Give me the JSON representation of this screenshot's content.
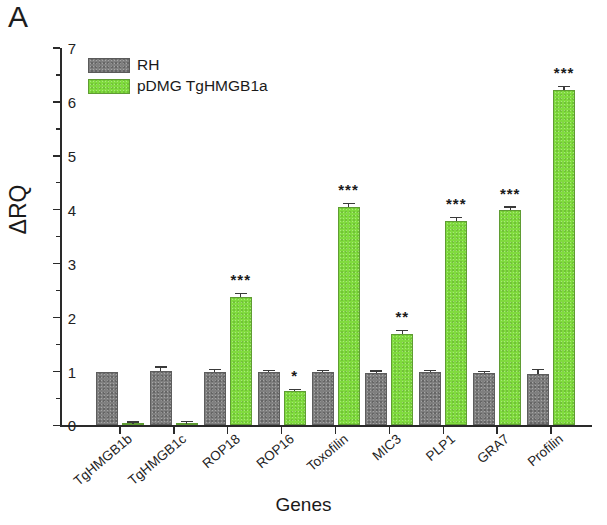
{
  "figure": {
    "panel_label": "A"
  },
  "legend": {
    "position": "top-left-inside",
    "entries": [
      {
        "label": "RH",
        "color": "#7f7f7f",
        "key": "rh"
      },
      {
        "label": "pDMG TgHMGB1a",
        "color": "#80db3e",
        "key": "pdmg"
      }
    ]
  },
  "chart_data": {
    "type": "bar",
    "title": "",
    "subtitle": "",
    "xlabel": "Genes",
    "ylabel": "ΔRQ",
    "ylim": [
      0,
      7
    ],
    "ytick_labels": [
      "0",
      "1",
      "2",
      "3",
      "4",
      "5",
      "6",
      "7"
    ],
    "ytick_values": [
      0,
      1,
      2,
      3,
      4,
      5,
      6,
      7
    ],
    "yminor_values": [
      0.5,
      1.5,
      2.5,
      3.5,
      4.5,
      5.5,
      6.5
    ],
    "grid": false,
    "categories": [
      "TgHMGB1b",
      "TgHMGB1c",
      "ROP18",
      "ROP16",
      "Toxofilin",
      "MIC3",
      "PLP1",
      "GRA7",
      "Profilin"
    ],
    "series": [
      {
        "name": "RH",
        "color": "#7f7f7f",
        "values": [
          1.0,
          1.01,
          1.0,
          0.99,
          0.99,
          0.98,
          0.99,
          0.97,
          0.96
        ],
        "errors": [
          0.0,
          0.06,
          0.02,
          0.02,
          0.02,
          0.02,
          0.02,
          0.02,
          0.06
        ]
      },
      {
        "name": "pDMG TgHMGB1a",
        "color": "#80db3e",
        "values": [
          0.03,
          0.03,
          2.38,
          0.63,
          4.05,
          1.7,
          3.8,
          4.0,
          6.22
        ],
        "errors": [
          0.02,
          0.03,
          0.05,
          0.03,
          0.05,
          0.05,
          0.04,
          0.04,
          0.06
        ]
      }
    ],
    "significance": [
      "",
      "",
      "***",
      "*",
      "***",
      "**",
      "***",
      "***",
      "***"
    ],
    "annotations": [
      {
        "category": "ROP18",
        "text": "***"
      },
      {
        "category": "ROP16",
        "text": "*"
      },
      {
        "category": "Toxofilin",
        "text": "***"
      },
      {
        "category": "MIC3",
        "text": "**"
      },
      {
        "category": "PLP1",
        "text": "***"
      },
      {
        "category": "GRA7",
        "text": "***"
      },
      {
        "category": "Profilin",
        "text": "***"
      }
    ]
  }
}
